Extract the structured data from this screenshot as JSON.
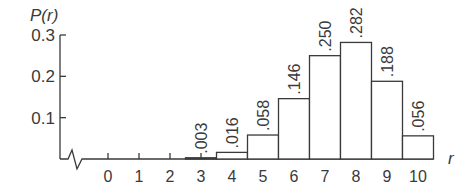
{
  "chart_data": {
    "type": "bar",
    "title": "",
    "ylabel": "P(r)",
    "xlabel": "r",
    "categories": [
      "0",
      "1",
      "2",
      "3",
      "4",
      "5",
      "6",
      "7",
      "8",
      "9",
      "10"
    ],
    "values": [
      0,
      0,
      0,
      0.003,
      0.016,
      0.058,
      0.146,
      0.25,
      0.282,
      0.188,
      0.056
    ],
    "bar_labels": [
      "",
      "",
      "",
      ".003",
      ".016",
      ".058",
      ".146",
      ".250",
      ".282",
      ".188",
      ".056"
    ],
    "yticks": [
      0.1,
      0.2,
      0.3
    ],
    "ytick_labels": [
      "0.1",
      "0.2",
      "0.3"
    ],
    "ylim": [
      0,
      0.3
    ],
    "grid": false,
    "axis_break": true,
    "legend": null
  },
  "colors": {
    "line": "#3a3a3a",
    "bar_fill": "#ffffff"
  }
}
